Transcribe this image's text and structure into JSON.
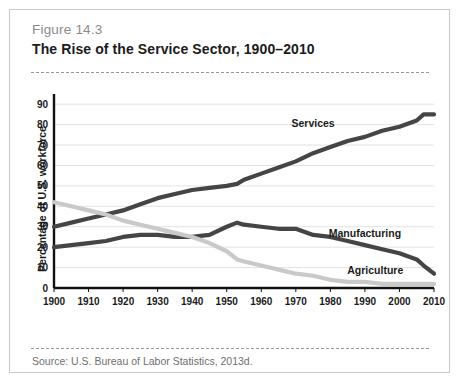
{
  "figure": {
    "number": "Figure 14.3",
    "title": "The Rise of the Service Sector, 1900–2010",
    "source": "Source: U.S. Bureau of Labor Statistics, 2013d."
  },
  "chart_data": {
    "type": "line",
    "title": "The Rise of the Service Sector, 1900–2010",
    "xlabel": "",
    "ylabel": "Percentage of U.S. workforce",
    "xlim": [
      1900,
      2010
    ],
    "ylim": [
      0,
      95
    ],
    "grid": true,
    "legend": "inline-labels",
    "xticks": [
      1900,
      1910,
      1920,
      1930,
      1940,
      1950,
      1960,
      1970,
      1980,
      1990,
      2000,
      2010
    ],
    "yticks": [
      0,
      10,
      20,
      30,
      40,
      50,
      60,
      70,
      80,
      90
    ],
    "x": [
      1900,
      1905,
      1910,
      1915,
      1920,
      1925,
      1930,
      1935,
      1940,
      1945,
      1950,
      1953,
      1955,
      1960,
      1965,
      1970,
      1975,
      1980,
      1985,
      1990,
      1995,
      2000,
      2005,
      2007,
      2010
    ],
    "series": [
      {
        "name": "Services",
        "color": "#454545",
        "values": [
          30,
          32,
          34,
          36,
          38,
          41,
          44,
          46,
          48,
          49,
          50,
          51,
          53,
          56,
          59,
          62,
          66,
          69,
          72,
          74,
          77,
          79,
          82,
          85,
          85
        ]
      },
      {
        "name": "Manufacturing",
        "color": "#454545",
        "values": [
          20,
          21,
          22,
          23,
          25,
          26,
          26,
          25,
          25,
          26,
          30,
          32,
          31,
          30,
          29,
          29,
          26,
          25,
          23,
          21,
          19,
          17,
          14,
          11,
          7
        ]
      },
      {
        "name": "Agriculture",
        "color": "#c9c9c9",
        "values": [
          42,
          40,
          38,
          36,
          33,
          31,
          29,
          27,
          25,
          22,
          18,
          14,
          13,
          11,
          9,
          7,
          6,
          4,
          3,
          3,
          2,
          2,
          2,
          2,
          2
        ]
      }
    ],
    "annotations": [
      {
        "text": "Services",
        "x": 1975,
        "y": 79
      },
      {
        "text": "Manufacturing",
        "x": 1990,
        "y": 25
      },
      {
        "text": "Agriculture",
        "x": 1993,
        "y": 7
      }
    ]
  }
}
